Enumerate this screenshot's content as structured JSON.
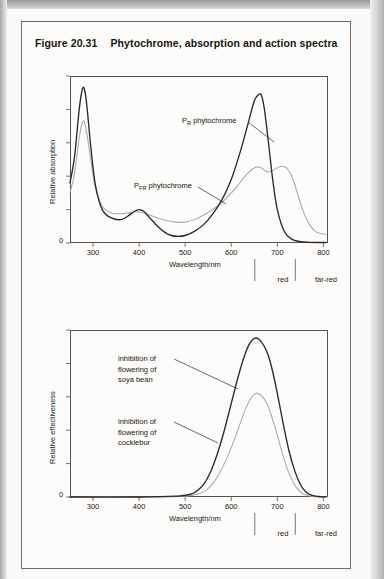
{
  "figure": {
    "number": "Figure 20.31",
    "title": "Phytochrome, absorption and action spectra"
  },
  "colors": {
    "curve_dark": "#2b2a28",
    "curve_light": "#a9a8a4",
    "axis": "#55534f",
    "text": "#1a1a16",
    "page": "#fdfcfa"
  },
  "panels": {
    "absorption": {
      "ylabel": "Relative absorption",
      "xlabel": "Wavelength/nm",
      "zero_label": "0",
      "xticks": [
        "300",
        "400",
        "500",
        "600",
        "700",
        "800"
      ],
      "band_red": "red",
      "band_far_red": "far-red",
      "label_pr": {
        "pre": "P",
        "sub": "R",
        "post": " phytochrome"
      },
      "label_pfr": {
        "pre": "P",
        "sub": "FR",
        "post": " phytochrome"
      }
    },
    "effectiveness": {
      "ylabel": "Relative effectiveness",
      "xlabel": "Wavelength/nm",
      "zero_label": "0",
      "xticks": [
        "300",
        "400",
        "500",
        "600",
        "700",
        "800"
      ],
      "band_red": "red",
      "band_far_red": "far-red",
      "label_soya": "inhibition of\nflowering of\nsoya bean",
      "label_soya_lines": [
        "inhibition of",
        "flowering of",
        "soya bean"
      ],
      "label_cocklebur_lines": [
        "inhibition of",
        "flowering of",
        "cocklebur"
      ]
    }
  },
  "chart_data": [
    {
      "type": "line",
      "title": "Phytochrome absorption spectra",
      "xlabel": "Wavelength/nm",
      "ylabel": "Relative absorption",
      "xlim": [
        250,
        810
      ],
      "ylim": [
        0,
        1.0
      ],
      "xticks": [
        300,
        400,
        500,
        600,
        700,
        800
      ],
      "grid": false,
      "legend": [
        "PR phytochrome",
        "PFR phytochrome"
      ],
      "annotations": [
        {
          "text": "PR phytochrome",
          "x": 600,
          "y": 0.85
        },
        {
          "text": "PFR phytochrome",
          "x": 500,
          "y": 0.46
        },
        {
          "text": "red",
          "x": 660
        },
        {
          "text": "far-red",
          "x": 730
        }
      ],
      "series": [
        {
          "name": "PR phytochrome",
          "color": "#2b2a28",
          "x": [
            250,
            260,
            270,
            278,
            285,
            295,
            305,
            320,
            340,
            360,
            375,
            390,
            400,
            410,
            425,
            440,
            455,
            470,
            485,
            500,
            520,
            540,
            560,
            580,
            600,
            620,
            635,
            650,
            660,
            666,
            672,
            680,
            690,
            700,
            715,
            730,
            750,
            770,
            790,
            805
          ],
          "y": [
            0.36,
            0.52,
            0.8,
            0.93,
            0.86,
            0.58,
            0.35,
            0.2,
            0.15,
            0.14,
            0.16,
            0.19,
            0.2,
            0.19,
            0.145,
            0.1,
            0.065,
            0.045,
            0.04,
            0.045,
            0.07,
            0.11,
            0.175,
            0.26,
            0.38,
            0.55,
            0.7,
            0.85,
            0.89,
            0.88,
            0.8,
            0.62,
            0.38,
            0.2,
            0.07,
            0.025,
            0.008,
            0.004,
            0.003,
            0.003
          ]
        },
        {
          "name": "PFR phytochrome",
          "color": "#a9a8a4",
          "x": [
            250,
            260,
            270,
            278,
            285,
            295,
            305,
            320,
            340,
            360,
            375,
            390,
            400,
            415,
            430,
            445,
            460,
            480,
            500,
            520,
            545,
            570,
            590,
            610,
            630,
            645,
            655,
            665,
            672,
            680,
            690,
            700,
            710,
            720,
            730,
            740,
            755,
            770,
            785,
            805
          ],
          "y": [
            0.3,
            0.42,
            0.63,
            0.73,
            0.68,
            0.5,
            0.33,
            0.22,
            0.18,
            0.175,
            0.18,
            0.185,
            0.185,
            0.175,
            0.16,
            0.145,
            0.135,
            0.125,
            0.125,
            0.14,
            0.175,
            0.22,
            0.27,
            0.33,
            0.4,
            0.44,
            0.455,
            0.45,
            0.435,
            0.425,
            0.435,
            0.45,
            0.46,
            0.45,
            0.41,
            0.33,
            0.2,
            0.11,
            0.065,
            0.05
          ]
        }
      ]
    },
    {
      "type": "line",
      "title": "Action spectra for inhibition of flowering",
      "xlabel": "Wavelength/nm",
      "ylabel": "Relative effectiveness",
      "xlim": [
        250,
        810
      ],
      "ylim": [
        0,
        1.0
      ],
      "xticks": [
        300,
        400,
        500,
        600,
        700,
        800
      ],
      "grid": false,
      "legend": [
        "inhibition of flowering of soya bean",
        "inhibition of flowering of cocklebur"
      ],
      "annotations": [
        {
          "text": "inhibition of flowering of soya bean",
          "x": 420,
          "y": 0.78
        },
        {
          "text": "inhibition of flowering of cocklebur",
          "x": 420,
          "y": 0.36
        },
        {
          "text": "red",
          "x": 660
        },
        {
          "text": "far-red",
          "x": 730
        }
      ],
      "series": [
        {
          "name": "inhibition of flowering of soya bean",
          "color": "#2b2a28",
          "x": [
            250,
            400,
            480,
            510,
            525,
            540,
            555,
            570,
            585,
            600,
            615,
            628,
            640,
            650,
            660,
            670,
            680,
            690,
            700,
            712,
            725,
            738,
            750,
            762,
            775,
            790,
            805
          ],
          "y": [
            0.0,
            0.0,
            0.005,
            0.015,
            0.035,
            0.075,
            0.15,
            0.26,
            0.4,
            0.56,
            0.72,
            0.84,
            0.92,
            0.95,
            0.945,
            0.91,
            0.85,
            0.75,
            0.62,
            0.45,
            0.28,
            0.155,
            0.075,
            0.03,
            0.01,
            0.003,
            0.0
          ]
        },
        {
          "name": "inhibition of flowering of cocklebur",
          "color": "#a9a8a4",
          "x": [
            250,
            430,
            500,
            530,
            545,
            560,
            575,
            590,
            605,
            618,
            630,
            640,
            650,
            658,
            668,
            678,
            688,
            698,
            710,
            722,
            735,
            748,
            762,
            778,
            795,
            805
          ],
          "y": [
            0.0,
            0.0,
            0.005,
            0.02,
            0.04,
            0.08,
            0.145,
            0.23,
            0.33,
            0.43,
            0.52,
            0.58,
            0.615,
            0.62,
            0.6,
            0.555,
            0.48,
            0.39,
            0.27,
            0.165,
            0.085,
            0.035,
            0.012,
            0.003,
            0.0,
            0.0
          ]
        }
      ]
    }
  ]
}
